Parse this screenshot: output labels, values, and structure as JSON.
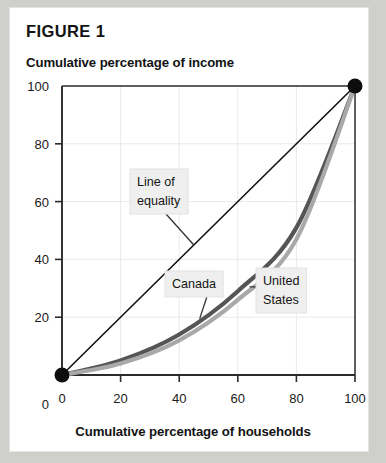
{
  "figure": {
    "title": "FIGURE 1"
  },
  "axes": {
    "y_title": "Cumulative percentage of income",
    "x_title": "Cumulative percentage of households"
  },
  "colors": {
    "page_background": "#cfcfcb",
    "sheet": "#ffffff",
    "axis": "#2b2b2b",
    "gridline": "#e9e9e9",
    "equality_line": "#111111",
    "canada_curve": "#555555",
    "united_states_curve": "#a9a9a9",
    "endpoint_marker": "#0d0d0d",
    "callout_box": "#efefef",
    "leader_line": "#333333",
    "text": "#131313"
  },
  "callouts": {
    "equality": {
      "line1": "Line of",
      "line2": "equality"
    },
    "canada": {
      "line1": "Canada"
    },
    "united_states": {
      "line1": "United",
      "line2": "States"
    }
  },
  "chart_data": {
    "type": "line",
    "title": "FIGURE 1",
    "xlabel": "Cumulative percentage of households",
    "ylabel": "Cumulative percentage of income",
    "xlim": [
      0,
      100
    ],
    "ylim": [
      0,
      100
    ],
    "xticks": [
      0,
      20,
      40,
      60,
      80,
      100
    ],
    "yticks": [
      0,
      20,
      40,
      60,
      80,
      100
    ],
    "xtick_labels": [
      "0",
      "20",
      "40",
      "60",
      "80",
      "100"
    ],
    "ytick_labels": [
      "0",
      "20",
      "40",
      "60",
      "80",
      "100"
    ],
    "grid": true,
    "legend": "annotations",
    "x": [
      0,
      20,
      40,
      60,
      80,
      100
    ],
    "series": [
      {
        "name": "Line of equality",
        "color": "#111111",
        "width": 1.6,
        "values": [
          0,
          20,
          40,
          60,
          80,
          100
        ]
      },
      {
        "name": "Canada",
        "color": "#555555",
        "width": 4.2,
        "values": [
          0,
          5,
          14,
          29,
          51,
          100
        ]
      },
      {
        "name": "United States",
        "color": "#a9a9a9",
        "width": 4.2,
        "values": [
          0,
          4,
          12,
          26,
          47,
          100
        ]
      }
    ],
    "markers": [
      {
        "x": 0,
        "y": 0
      },
      {
        "x": 100,
        "y": 100
      }
    ],
    "annotations": [
      {
        "text": "Line of equality",
        "x": 26,
        "y": 62
      },
      {
        "text": "Canada",
        "x": 43,
        "y": 30
      },
      {
        "text": "United States",
        "x": 80,
        "y": 31
      }
    ]
  }
}
